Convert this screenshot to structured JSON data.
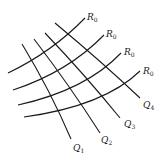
{
  "diagram": {
    "stroke_color": "#1a1a1a",
    "background": "#ffffff",
    "r_curves": [
      {
        "id": "r1",
        "path": "M 8 73 Q 52 52 85 18",
        "label": "R",
        "subscript": "0",
        "label_x": 87,
        "label_y": 20
      },
      {
        "id": "r2",
        "path": "M 13 90 Q 68 72 104 35",
        "label": "R",
        "subscript": "0",
        "label_x": 106,
        "label_y": 37
      },
      {
        "id": "r3",
        "path": "M 18 105 Q 86 90 121 53",
        "label": "R",
        "subscript": "0",
        "label_x": 124,
        "label_y": 55
      },
      {
        "id": "r4",
        "path": "M 24 117 Q 104 106 140 71",
        "label": "R",
        "subscript": "0",
        "label_x": 143,
        "label_y": 74
      }
    ],
    "q_curves": [
      {
        "id": "q1",
        "path": "M 22 44 Q 50 90 71 139",
        "label": "Q",
        "subscript": "1",
        "label_x": 73,
        "label_y": 151
      },
      {
        "id": "q2",
        "path": "M 34 39 Q 70 86 100 133",
        "label": "Q",
        "subscript": "2",
        "label_x": 101,
        "label_y": 143
      },
      {
        "id": "q3",
        "path": "M 45 33 Q 86 76 120 118",
        "label": "Q",
        "subscript": "3",
        "label_x": 124,
        "label_y": 127
      },
      {
        "id": "q4",
        "path": "M 55 23 Q 102 62 140 98",
        "label": "Q",
        "subscript": "4",
        "label_x": 143,
        "label_y": 108
      }
    ]
  }
}
